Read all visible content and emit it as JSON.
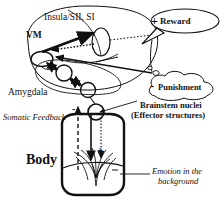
{
  "figure": {
    "type": "neuroanatomical-schematic",
    "background_color": "#ffffff",
    "ink_color": "#111111"
  },
  "labels": {
    "insula": "Insula/SII, SI",
    "vm": "VM",
    "amygdala": "Amygdala",
    "reward": "Reward",
    "reward_sign": "+",
    "punishment": "Punishment",
    "punishment_sign": "-",
    "brainstem_line1": "Brainstem nuclei",
    "brainstem_line2": "(Effector structures)",
    "somatic_feedback": "Somatic Feedback",
    "body": "Body",
    "emotion_line1": "Emotion in the",
    "emotion_line2": "background",
    "somatic_feedback_sign": "-",
    "body_minus_sign": "-",
    "body_plus_sign": "+"
  }
}
